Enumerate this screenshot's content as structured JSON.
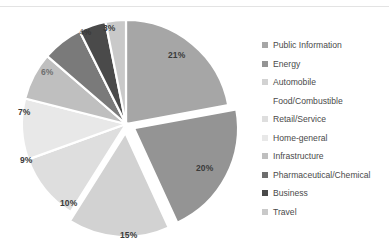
{
  "chart_data": {
    "type": "pie",
    "title": "",
    "categories": [
      "Public Information",
      "Energy",
      "Automobile Food/Combustible",
      "Retail/Service",
      "Home-general",
      "Infrastructure",
      "Pharmaceutical/Chemical",
      "Business",
      "Travel"
    ],
    "values": [
      21,
      20,
      15,
      10,
      9,
      7,
      6,
      4,
      3
    ],
    "value_labels": [
      "21%",
      "20%",
      "15%",
      "10%",
      "9%",
      "7%",
      "6%",
      "4%",
      "3%"
    ],
    "colors": [
      "#a6a6a6",
      "#949494",
      "#d2d2d2",
      "#dedede",
      "#e8e8e8",
      "#bfbfbf",
      "#7a7a7a",
      "#4a4a4a",
      "#c9c9c9"
    ],
    "exploded": [
      false,
      true,
      true,
      false,
      false,
      false,
      false,
      false,
      false
    ],
    "legend_position": "right",
    "grid": false,
    "start_angle_deg": 0,
    "direction": "clockwise"
  },
  "legend": {
    "items": [
      {
        "label": "Public Information",
        "color": "#a6a6a6",
        "has_marker": true
      },
      {
        "label": "Energy",
        "color": "#949494",
        "has_marker": true
      },
      {
        "label": "Automobile",
        "color": "#d2d2d2",
        "has_marker": true
      },
      {
        "label": "Food/Combustible",
        "color": "#d2d2d2",
        "has_marker": false
      },
      {
        "label": "Retail/Service",
        "color": "#dedede",
        "has_marker": true
      },
      {
        "label": "Home-general",
        "color": "#e8e8e8",
        "has_marker": true
      },
      {
        "label": "Infrastructure",
        "color": "#bfbfbf",
        "has_marker": true
      },
      {
        "label": "Pharmaceutical/Chemical",
        "color": "#6e6e6e",
        "has_marker": true
      },
      {
        "label": "Business",
        "color": "#4a4a4a",
        "has_marker": true
      },
      {
        "label": "Travel",
        "color": "#c9c9c9",
        "has_marker": true
      }
    ]
  },
  "slice_labels": [
    {
      "text": "21%",
      "x": 168,
      "y": 50,
      "dark": false
    },
    {
      "text": "20%",
      "x": 196,
      "y": 163,
      "dark": false
    },
    {
      "text": "15%",
      "x": 120,
      "y": 230,
      "dark": false
    },
    {
      "text": "10%",
      "x": 60,
      "y": 198,
      "dark": false
    },
    {
      "text": "9%",
      "x": 20,
      "y": 155,
      "dark": false
    },
    {
      "text": "7%",
      "x": 18,
      "y": 107,
      "dark": false
    },
    {
      "text": "6%",
      "x": 41,
      "y": 67,
      "dark": true
    },
    {
      "text": "4%",
      "x": 79,
      "y": 27,
      "dark": true
    },
    {
      "text": "3%",
      "x": 103,
      "y": 23,
      "dark": false
    }
  ]
}
